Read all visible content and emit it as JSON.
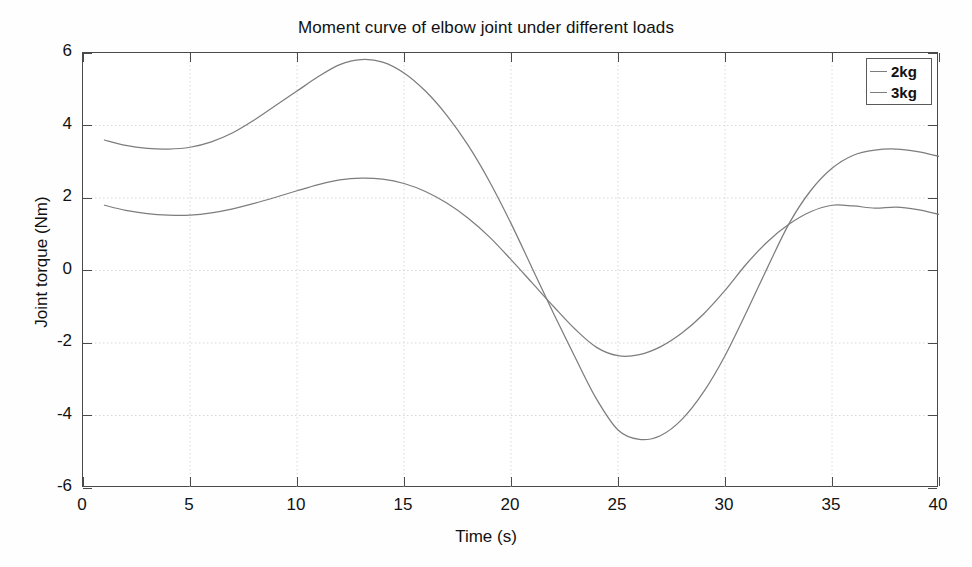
{
  "chart_data": {
    "type": "line",
    "title": "Moment curve of elbow joint under different loads",
    "xlabel": "Time (s)",
    "ylabel": "Joint torque (Nm)",
    "xlim": [
      0,
      40
    ],
    "ylim": [
      -6,
      6
    ],
    "xticks": [
      0,
      5,
      10,
      15,
      20,
      25,
      30,
      35,
      40
    ],
    "yticks": [
      6,
      4,
      2,
      0,
      -2,
      -4,
      -6
    ],
    "xtick_labels": [
      "0",
      "5",
      "10",
      "15",
      "20",
      "25",
      "30",
      "35",
      "40"
    ],
    "ytick_labels": [
      "6",
      "4",
      "2",
      "0",
      "-2",
      "-4",
      "-6"
    ],
    "grid": true,
    "grid_style": "dotted",
    "legend_position": "top-right",
    "x": [
      1,
      2,
      3,
      4,
      5,
      6,
      7,
      8,
      9,
      10,
      11,
      12,
      13,
      14,
      15,
      16,
      17,
      18,
      19,
      20,
      21,
      22,
      23,
      24,
      25,
      26,
      27,
      28,
      29,
      30,
      31,
      32,
      33,
      34,
      35,
      36,
      37,
      38,
      39,
      40
    ],
    "series": [
      {
        "name": "2kg",
        "color": "#7d7d7d",
        "values": [
          1.8,
          1.66,
          1.57,
          1.53,
          1.53,
          1.59,
          1.7,
          1.85,
          2.02,
          2.2,
          2.37,
          2.5,
          2.55,
          2.52,
          2.4,
          2.18,
          1.86,
          1.44,
          0.92,
          0.3,
          -0.35,
          -1.0,
          -1.62,
          -2.12,
          -2.35,
          -2.32,
          -2.1,
          -1.72,
          -1.2,
          -0.55,
          0.18,
          0.8,
          1.28,
          1.62,
          1.8,
          1.78,
          1.72,
          1.75,
          1.68,
          1.55
        ]
      },
      {
        "name": "3kg",
        "color": "#7d7d7d",
        "values": [
          3.6,
          3.45,
          3.37,
          3.35,
          3.4,
          3.55,
          3.8,
          4.15,
          4.55,
          4.95,
          5.35,
          5.68,
          5.82,
          5.75,
          5.45,
          4.95,
          4.28,
          3.45,
          2.45,
          1.3,
          0.05,
          -1.2,
          -2.4,
          -3.55,
          -4.4,
          -4.66,
          -4.55,
          -4.1,
          -3.35,
          -2.35,
          -1.15,
          0.1,
          1.3,
          2.2,
          2.82,
          3.18,
          3.32,
          3.35,
          3.28,
          3.15
        ]
      }
    ],
    "annotations": []
  },
  "legend": {
    "entries": [
      {
        "label": "2kg"
      },
      {
        "label": "3kg"
      }
    ]
  },
  "artifacts": {
    "ghost_text_1": "",
    "ghost_text_2": "",
    "ghost_text_3": "",
    "ghost_text_4": "",
    "ghost_text_5": "",
    "ghost_text_6": ""
  },
  "colors": {
    "axis": "#4a4a4a",
    "grid": "#d8d8d8",
    "line": "#7d7d7d",
    "text": "#111111",
    "background": "#ffffff"
  }
}
